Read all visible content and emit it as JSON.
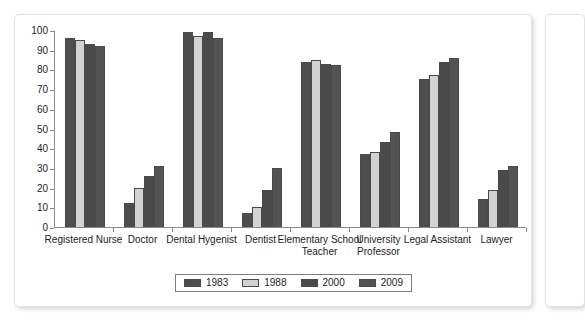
{
  "panel": {
    "background_color": "#ffffff",
    "border_color": "#e2e2e2"
  },
  "chart_data": {
    "type": "bar",
    "title": "",
    "subtitle": "",
    "xlabel": "",
    "ylabel": "",
    "ylim": [
      0,
      100
    ],
    "ytick_step": 10,
    "yticks": [
      0,
      10,
      20,
      30,
      40,
      50,
      60,
      70,
      80,
      90,
      100
    ],
    "grid": false,
    "legend_position": "bottom-center",
    "categories": [
      "Registered Nurse",
      "Doctor",
      "Dental Hygenist",
      "Dentist",
      "Elementary School Teacher",
      "University Professor",
      "Legal Assistant",
      "Lawyer"
    ],
    "series": [
      {
        "name": "1983",
        "color": "#4d4d4d",
        "values": [
          96,
          12,
          99,
          7,
          84,
          37,
          75,
          14
        ]
      },
      {
        "name": "1988",
        "color": "#d2d2d2",
        "values": [
          95,
          20,
          97,
          10,
          85,
          38,
          77,
          19
        ]
      },
      {
        "name": "2000",
        "color": "#4a4a4a",
        "values": [
          93,
          26,
          99,
          19,
          83,
          43,
          84,
          29
        ]
      },
      {
        "name": "2009",
        "color": "#535353",
        "values": [
          92,
          31,
          96,
          30,
          82,
          48,
          86,
          31
        ]
      }
    ]
  }
}
